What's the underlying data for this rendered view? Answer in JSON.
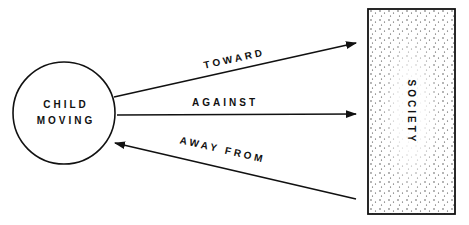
{
  "diagram": {
    "child": {
      "line1": "CHILD",
      "line2": "MOVING"
    },
    "society": {
      "label": "SOCIETY"
    },
    "arrows": [
      {
        "label": "TOWARD",
        "direction": "child-to-society"
      },
      {
        "label": "AGAINST",
        "direction": "child-to-society"
      },
      {
        "label": "AWAY FROM",
        "direction": "society-to-child"
      }
    ],
    "colors": {
      "stroke": "#111111",
      "background": "#ffffff",
      "stipple": "#333333"
    }
  }
}
